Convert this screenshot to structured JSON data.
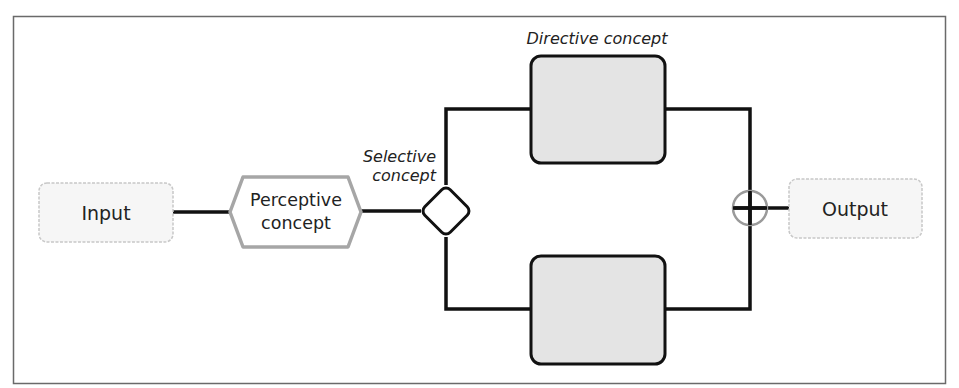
{
  "diagram": {
    "type": "flow",
    "nodes": {
      "input": {
        "label": "Input",
        "shape": "dashed-rounded-rect"
      },
      "perceptive": {
        "label_line1": "Perceptive",
        "label_line2": "concept",
        "shape": "hexagon"
      },
      "selective": {
        "label_line1": "Selective",
        "label_line2": "concept",
        "shape": "diamond"
      },
      "directive_top": {
        "caption": "Directive concept",
        "shape": "rounded-rect"
      },
      "directive_bottom": {
        "caption": "",
        "shape": "rounded-rect"
      },
      "merge": {
        "shape": "circle-plus"
      },
      "output": {
        "label": "Output",
        "shape": "dashed-rounded-rect"
      }
    },
    "edges": [
      [
        "input",
        "perceptive"
      ],
      [
        "perceptive",
        "selective"
      ],
      [
        "selective",
        "directive_top"
      ],
      [
        "selective",
        "directive_bottom"
      ],
      [
        "directive_top",
        "merge"
      ],
      [
        "directive_bottom",
        "merge"
      ],
      [
        "merge",
        "output"
      ]
    ],
    "colors": {
      "line": "#111111",
      "box_fill": "#e4e4e4",
      "io_border": "#c8c8c8",
      "io_fill": "#f6f6f6",
      "hex_border": "#a6a6a6",
      "merge_circle": "#9a9a9a",
      "frame": "#555555"
    }
  }
}
